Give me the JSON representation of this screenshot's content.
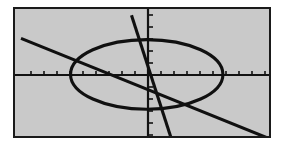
{
  "screen": {
    "name": "graphing-calculator-screen",
    "background_color": "#c9c9c9",
    "border_color": "#1a1a1a",
    "ink_color": "#101010",
    "width_px": 258,
    "height_px": 131
  },
  "chart_data": {
    "type": "line",
    "title": "",
    "subtitle": "",
    "xlabel": "",
    "ylabel": "",
    "grid": false,
    "legend_position": "none",
    "axis_style": "centered-crosshair-with-tick-marks",
    "xlim": [
      -10,
      10
    ],
    "ylim": [
      -5.2,
      5.2
    ],
    "origin_px": {
      "x": 133,
      "y": 66
    },
    "x_ticks": [
      -9,
      -8,
      -7,
      -6,
      -5,
      -4,
      -3,
      -2,
      -1,
      1,
      2,
      3,
      4,
      5,
      6,
      7,
      8,
      9
    ],
    "y_ticks": [
      -5,
      -4,
      -3,
      -2,
      -1,
      1,
      2,
      3,
      4,
      5
    ],
    "x_tick_count": 18,
    "y_tick_count": 10,
    "series": [
      {
        "name": "ellipse",
        "kind": "conic-ellipse",
        "center": [
          -0.1,
          0.05
        ],
        "semi_axis_x": 6.0,
        "semi_axis_y": 2.85,
        "rotation_deg": 0,
        "closed": true
      },
      {
        "name": "line-shallow-negative-slope",
        "kind": "straight-line",
        "slope": -0.42,
        "intercept": -1.2,
        "points": [
          [
            -10,
            3.0
          ],
          [
            10,
            -5.4
          ]
        ],
        "x_axis_crossing": 9.0,
        "left_edge_y": 0.95,
        "right_edge_y": -0.55
      },
      {
        "name": "line-steep-negative-slope",
        "kind": "straight-line",
        "slope": -4.6,
        "intercept": -1.5,
        "points": [
          [
            -1.3,
            4.9
          ],
          [
            1.8,
            -5.1
          ]
        ],
        "top_edge_x": -0.3,
        "bottom_edge_x": 1.7
      }
    ],
    "annotations": []
  }
}
